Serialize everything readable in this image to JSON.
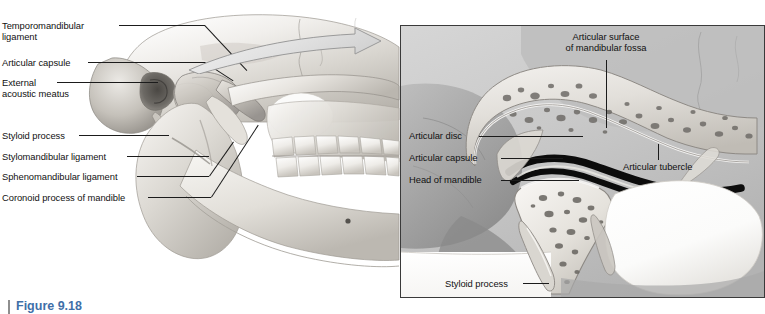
{
  "figure": {
    "caption": "Figure 9.18",
    "caption_rule_color": "#8e8e8e",
    "caption_color": "#3f6fa8"
  },
  "colors": {
    "page_background": "#ffffff",
    "left_panel_background": "#ffffff",
    "right_panel_background": "#c9c9c9",
    "right_panel_border": "#3a3a3a",
    "bone_light": "#f2f0ec",
    "bone_mid": "#c3bfb8",
    "bone_shadow": "#8d8a85",
    "disc_dark": "#111111",
    "leader_line": "#1b1b1b",
    "label_text": "#111111",
    "arrow_fill": "#e6e6e6",
    "arrow_stroke": "#9a9a9a"
  },
  "left_panel": {
    "name": "lateral view of skull and mandible showing temporomandibular joint ligaments",
    "labels": [
      {
        "id": "temporomandibular-ligament",
        "text": "Temporomandibular\nligament",
        "x": 2,
        "y": 20
      },
      {
        "id": "articular-capsule",
        "text": "Articular capsule",
        "x": 2,
        "y": 58
      },
      {
        "id": "external-acoustic-meatus",
        "text": "External\nacoustic meatus",
        "x": 2,
        "y": 78
      },
      {
        "id": "styloid-process",
        "text": "Styloid process",
        "x": 2,
        "y": 131
      },
      {
        "id": "stylomandibular-ligament",
        "text": "Stylomandibular ligament",
        "x": 2,
        "y": 152
      },
      {
        "id": "sphenomandibular-ligament",
        "text": "Sphenomandibular ligament",
        "x": 2,
        "y": 172
      },
      {
        "id": "coronoid-process-of-mandible",
        "text": "Coronoid process of mandible",
        "x": 2,
        "y": 193
      }
    ]
  },
  "right_panel": {
    "name": "magnified sagittal section of the temporomandibular joint",
    "labels": [
      {
        "id": "articular-surface-of-mandibular-fossa",
        "text": "Articular surface\nof mandibular fossa",
        "x": 166,
        "y": 5,
        "align": "center"
      },
      {
        "id": "articular-disc",
        "text": "Articular disc",
        "x": 8,
        "y": 104,
        "align": "left"
      },
      {
        "id": "articular-capsule",
        "text": "Articular capsule",
        "x": 8,
        "y": 126,
        "align": "left"
      },
      {
        "id": "head-of-mandible",
        "text": "Head of mandible",
        "x": 8,
        "y": 148,
        "align": "left"
      },
      {
        "id": "articular-tubercle",
        "text": "Articular tubercle",
        "x": 238,
        "y": 134,
        "align": "left"
      },
      {
        "id": "styloid-process",
        "text": "Styloid process",
        "x": 44,
        "y": 252,
        "align": "left"
      }
    ]
  },
  "magnification_arrow": {
    "id": "magnification-arrow",
    "description": "curved arrow from left panel temporomandibular joint to magnified right panel"
  }
}
